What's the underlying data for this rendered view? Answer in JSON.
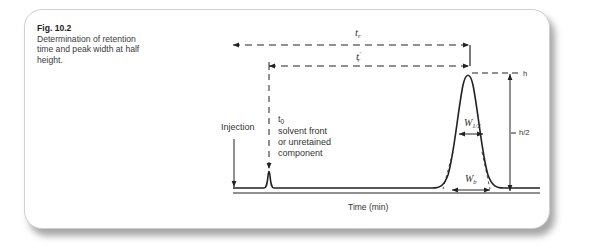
{
  "figure": {
    "number": "Fig. 10.2",
    "caption": "Determination of retention time and peak width at half height."
  },
  "labels": {
    "tr": "t",
    "tr_sub": "r",
    "tr_prime": "t",
    "tr_prime_sub": "r",
    "tr_prime_mark": "′",
    "h": "h",
    "h_half": "h/2",
    "injection": "Injection",
    "t0": "t",
    "t0_sub": "0",
    "t0_line1": "solvent front",
    "t0_line2": "or unretained",
    "t0_line3": "component",
    "w_half": "W",
    "w_half_sub": "1/2",
    "w_b": "W",
    "w_b_sub": "b",
    "x_axis": "Time (min)"
  },
  "colors": {
    "line": "#222222",
    "card_border": "#cfcfcf"
  }
}
